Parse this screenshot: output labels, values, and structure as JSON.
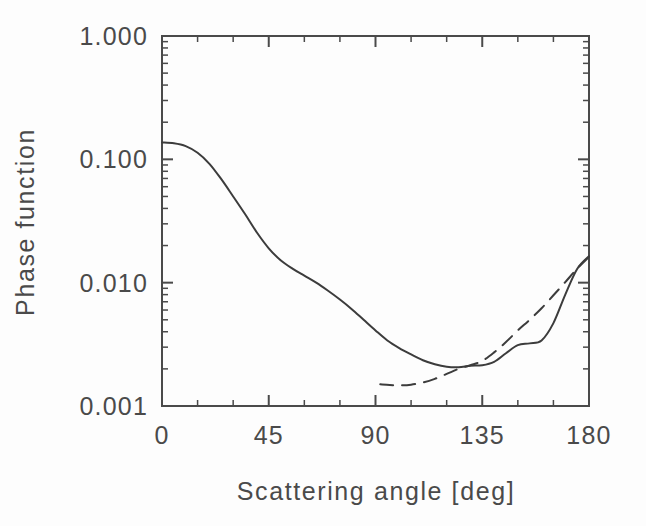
{
  "figure": {
    "background_color": "#fdfdfd",
    "axis_color": "#4a4a4a",
    "curve_color": "#3c3c3c",
    "width": 646,
    "height": 526
  },
  "axes": {
    "x_label": "Scattering angle [deg]",
    "y_label": "Phase function",
    "x_ticks": [
      "0",
      "45",
      "90",
      "135",
      "180"
    ],
    "y_ticks": [
      "1.000",
      "0.100",
      "0.010",
      "0.001"
    ]
  },
  "chart_data": {
    "type": "line",
    "title": "",
    "xlabel": "Scattering angle [deg]",
    "ylabel": "Phase function",
    "xlim": [
      0,
      180
    ],
    "ylim": [
      0.001,
      1.0
    ],
    "yscale": "log",
    "xscale": "linear",
    "xticks": [
      0,
      45,
      90,
      135,
      180
    ],
    "yticks": [
      0.001,
      0.01,
      0.1,
      1.0
    ],
    "ytick_labels": [
      "0.001",
      "0.010",
      "0.100",
      "1.000"
    ],
    "xtick_labels": [
      "0",
      "45",
      "90",
      "135",
      "180"
    ],
    "grid": false,
    "legend": "none",
    "minor_ticks": true,
    "series": [
      {
        "name": "solid-curve",
        "style": "solid",
        "x": [
          0,
          5,
          10,
          15,
          20,
          25,
          30,
          35,
          40,
          45,
          50,
          55,
          60,
          65,
          70,
          75,
          80,
          85,
          90,
          95,
          100,
          105,
          110,
          115,
          120,
          125,
          130,
          135,
          140,
          145,
          150,
          155,
          160,
          165,
          170,
          175,
          180
        ],
        "y": [
          0.137,
          0.135,
          0.128,
          0.113,
          0.092,
          0.069,
          0.05,
          0.036,
          0.0255,
          0.019,
          0.0152,
          0.013,
          0.0114,
          0.01,
          0.0086,
          0.0073,
          0.0061,
          0.005,
          0.0041,
          0.0034,
          0.00295,
          0.00262,
          0.00235,
          0.00218,
          0.00208,
          0.00206,
          0.00212,
          0.00214,
          0.00228,
          0.00268,
          0.00312,
          0.00322,
          0.0034,
          0.0047,
          0.008,
          0.0129,
          0.0164
        ]
      },
      {
        "name": "dashed-curve",
        "style": "dashed",
        "x": [
          92,
          96,
          100,
          105,
          110,
          115,
          120,
          125,
          130,
          135,
          140,
          145,
          150,
          155,
          160,
          165,
          170,
          175,
          180
        ],
        "y": [
          0.0015,
          0.00148,
          0.00147,
          0.00149,
          0.00155,
          0.00166,
          0.00182,
          0.002,
          0.00214,
          0.00232,
          0.00272,
          0.0033,
          0.0041,
          0.005,
          0.0062,
          0.0079,
          0.0101,
          0.013,
          0.0162
        ]
      }
    ]
  }
}
